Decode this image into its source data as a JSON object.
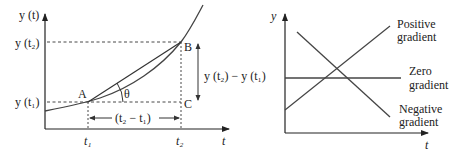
{
  "colors": {
    "ink": "#333333",
    "background": "#ffffff"
  },
  "left_diagram": {
    "y_axis_label": "y (t)",
    "x_axis_label": "t",
    "y_tick_t2": "y (t₂)",
    "y_tick_t1": "y (t₁)",
    "x_tick_t1": "t₁",
    "x_tick_t2": "t₂",
    "point_a": "A",
    "point_b": "B",
    "point_c": "C",
    "angle_label": "θ",
    "vertical_span_label": "y (t₂) − y (t₁)",
    "horizontal_span_label": "(t₂ − t₁)"
  },
  "right_diagram": {
    "y_axis_label": "y",
    "x_axis_label": "t",
    "positive_label_line1": "Positive",
    "positive_label_line2": "gradient",
    "zero_label_line1": "Zero",
    "zero_label_line2": "gradient",
    "negative_label_line1": "Negative",
    "negative_label_line2": "gradient"
  }
}
